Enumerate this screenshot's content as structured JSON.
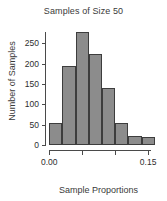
{
  "chart_data": {
    "type": "bar",
    "title": "Samples of Size 50",
    "xlabel": "Sample Proportions",
    "ylabel": "Number of Samples",
    "grid": false,
    "legend": null,
    "bin_width": 0.02,
    "bin_edges": [
      0.0,
      0.02,
      0.04,
      0.06,
      0.08,
      0.1,
      0.12,
      0.14,
      0.16
    ],
    "categories": [
      "0.00-0.02",
      "0.02-0.04",
      "0.04-0.06",
      "0.06-0.08",
      "0.08-0.10",
      "0.10-0.12",
      "0.12-0.14",
      "0.14-0.16"
    ],
    "values": [
      54,
      195,
      278,
      224,
      140,
      53,
      21,
      19
    ],
    "xlim": [
      -0.005,
      0.168
    ],
    "ylim": [
      0,
      278
    ],
    "xticks": [
      0.0,
      0.05,
      0.1,
      0.15
    ],
    "xtick_labels": [
      "0.00",
      "",
      "",
      "0.15"
    ],
    "yticks": [
      0,
      50,
      100,
      150,
      200,
      250
    ],
    "ytick_labels": [
      "0",
      "50",
      "100",
      "150",
      "200",
      "250"
    ],
    "bar_fill": "#8c8c8c",
    "bar_edge": "#3d3d3d",
    "axis_color": "#4a4a4a",
    "text_color": "#2e2e2e",
    "background": "#ffffff"
  }
}
